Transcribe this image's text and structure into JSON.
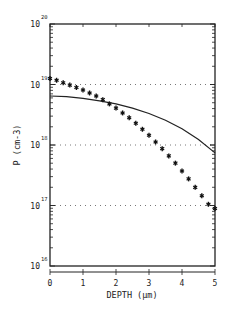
{
  "chart_data": {
    "type": "line",
    "title": "",
    "xlabel": "DEPTH (µm)",
    "ylabel": "P (cm-3)",
    "xlim": [
      0,
      5
    ],
    "ylim": [
      1e+16,
      1e+20
    ],
    "yscale": "log",
    "grid": "dotted horizontal lines at 1e17, 1e18, 1e19",
    "x_ticks": [
      "0",
      "1",
      "2",
      "3",
      "4",
      "5"
    ],
    "y_ticks": [
      {
        "base": "10",
        "exp": "20"
      },
      {
        "base": "10",
        "exp": "19"
      },
      {
        "base": "10",
        "exp": "18"
      },
      {
        "base": "10",
        "exp": "17"
      },
      {
        "base": "10",
        "exp": "16"
      }
    ],
    "legend": [],
    "series": [
      {
        "name": "measured (stars)",
        "style": "markers",
        "x": [
          0.0,
          0.2,
          0.4,
          0.6,
          0.8,
          1.0,
          1.2,
          1.4,
          1.6,
          1.8,
          2.0,
          2.2,
          2.4,
          2.6,
          2.8,
          3.0,
          3.2,
          3.4,
          3.6,
          3.8,
          4.0,
          4.2,
          4.4,
          4.6,
          4.8,
          5.0
        ],
        "log10_y": [
          19.1,
          19.07,
          19.03,
          18.99,
          18.95,
          18.91,
          18.86,
          18.81,
          18.75,
          18.68,
          18.61,
          18.53,
          18.45,
          18.36,
          18.26,
          18.16,
          18.05,
          17.94,
          17.82,
          17.7,
          17.57,
          17.44,
          17.3,
          17.16,
          17.02,
          16.95
        ]
      },
      {
        "name": "simulated (solid)",
        "style": "line",
        "x": [
          0.0,
          0.5,
          1.0,
          1.5,
          2.0,
          2.5,
          3.0,
          3.5,
          4.0,
          4.5,
          5.0
        ],
        "log10_y": [
          18.81,
          18.8,
          18.77,
          18.73,
          18.68,
          18.61,
          18.52,
          18.41,
          18.27,
          18.09,
          17.87
        ]
      }
    ]
  }
}
